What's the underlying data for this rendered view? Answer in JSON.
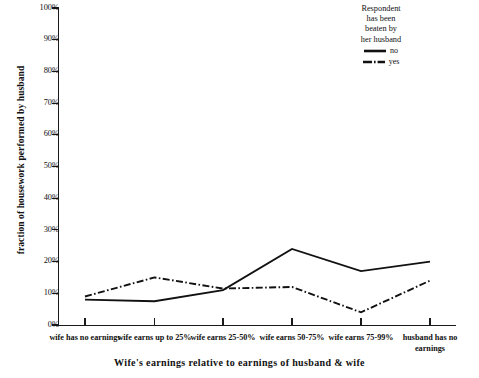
{
  "chart_data": {
    "type": "line",
    "title": "",
    "xlabel": "Wife's earnings relative to earnings of husband & wife",
    "ylabel": "fraction of housework performed by husband",
    "categories": [
      "wife has no earnings",
      "wife earns up to 25%",
      "wife earns 25-50%",
      "wife earns 50-75%",
      "wife earns 75-99%",
      "husband has no earnings"
    ],
    "series": [
      {
        "name": "no",
        "values": [
          8,
          7.5,
          11,
          24,
          17,
          20
        ],
        "style": "solid"
      },
      {
        "name": "yes",
        "values": [
          9,
          15,
          11.5,
          12,
          4,
          14
        ],
        "style": "dash-dot"
      }
    ],
    "ylim": [
      0,
      100
    ],
    "ytick_labels": [
      "0%",
      "10%",
      "20%",
      "30%",
      "40%",
      "50%",
      "60%",
      "70%",
      "80%",
      "90%",
      "100%"
    ],
    "ytick_values": [
      0,
      10,
      20,
      30,
      40,
      50,
      60,
      70,
      80,
      90,
      100
    ],
    "grid": false,
    "legend": {
      "position": "top-right",
      "title": "Respondent has been beaten by her husband",
      "title_lines": [
        "Respondent",
        "has been",
        "beaten by",
        "her husband"
      ],
      "entries": [
        {
          "label": "no",
          "style": "solid"
        },
        {
          "label": "yes",
          "style": "dash-dot"
        }
      ]
    },
    "line_color": "#111111"
  }
}
